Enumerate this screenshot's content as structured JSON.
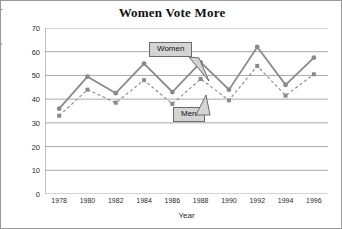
{
  "chart_data": {
    "type": "line",
    "title": "Women Vote More",
    "xlabel": "Year",
    "ylabel": "Voters (in millions)",
    "categories": [
      "1978",
      "1980",
      "1982",
      "1984",
      "1986",
      "1988",
      "1990",
      "1992",
      "1994",
      "1996"
    ],
    "xticks": [
      "1978",
      "1980",
      "1982",
      "1984",
      "1986",
      "1988",
      "1990",
      "1992",
      "1994",
      "1996"
    ],
    "yticks": [
      "0",
      "10",
      "20",
      "30",
      "40",
      "50",
      "60",
      "70"
    ],
    "ylim": [
      0,
      70
    ],
    "grid": "horizontal",
    "legend_position": "inline-callouts",
    "series": [
      {
        "name": "Women",
        "style": "solid",
        "marker": "circle",
        "color": "#8a8a8a",
        "values": [
          36,
          49.5,
          42.5,
          55,
          43,
          55.5,
          44,
          62,
          46,
          57.5
        ]
      },
      {
        "name": "Men",
        "style": "dashed",
        "marker": "square",
        "color": "#8a8a8a",
        "values": [
          33,
          44,
          38.5,
          48,
          38,
          48.5,
          39.5,
          54,
          41.5,
          50.5
        ]
      }
    ],
    "annotations": [
      {
        "label": "Women",
        "points_to": "women-series"
      },
      {
        "label": "Men",
        "points_to": "men-series"
      }
    ]
  },
  "colors": {
    "grid": "#a9a9a9",
    "axis": "#9a9a9a",
    "series": "#8a8a8a",
    "callout_fill": "#d4d4d4",
    "callout_border": "#6b6b6b",
    "text": "#2b2b2b",
    "title": "#111111"
  }
}
